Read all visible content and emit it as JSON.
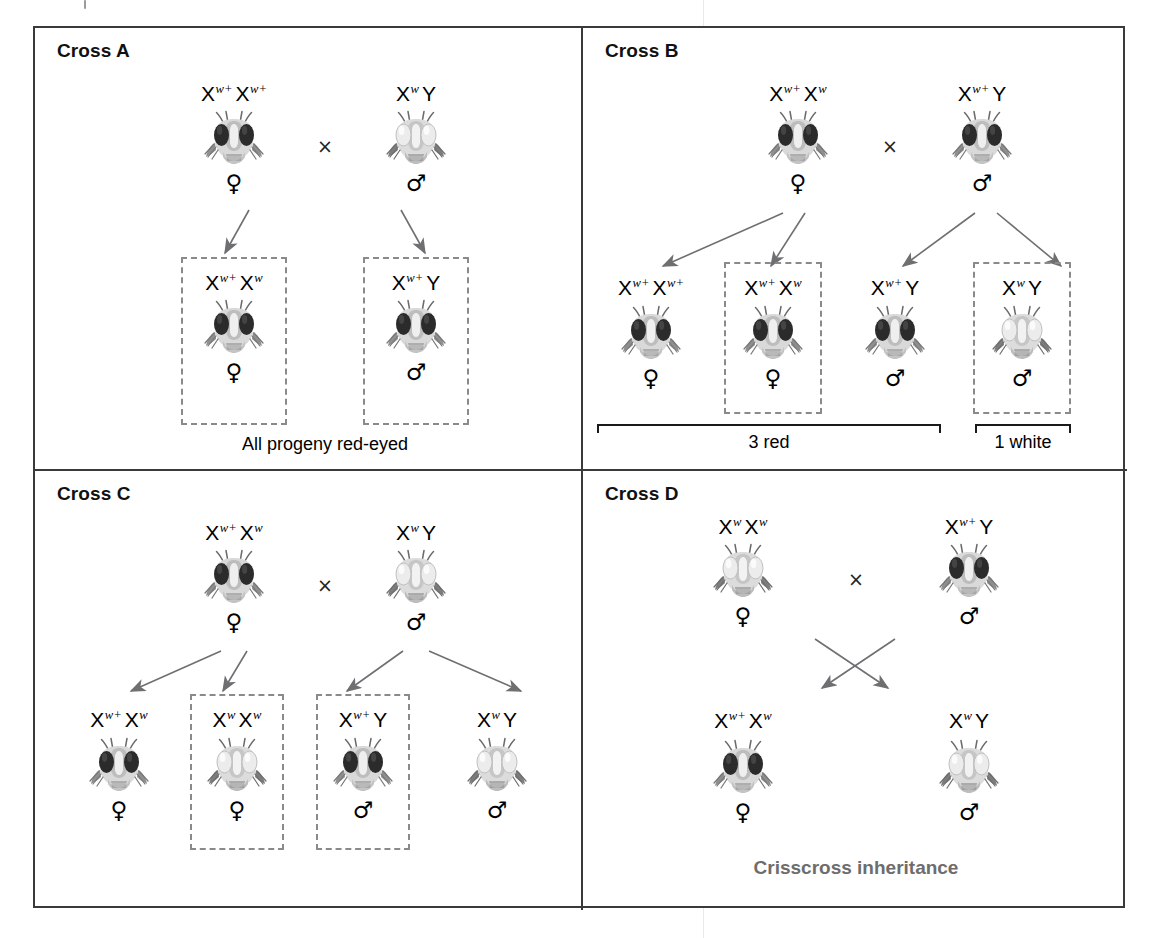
{
  "figure": {
    "eye_colors": {
      "red": "#2b2b2b",
      "white": "#e6e6e6"
    },
    "accent_gray": "#6d6d6d",
    "dash_gray": "#8a8a8a",
    "arrow_gray": "#6f6f72"
  },
  "symbols": {
    "female": "♀",
    "male": "♂",
    "multiply": "×",
    "allele_X": "X",
    "allele_Y": "Y",
    "sup_wildtype": "w+",
    "sup_white": "w"
  },
  "panels": [
    {
      "id": "cross-a",
      "title": "Cross A",
      "parents": [
        {
          "genotype_html": "X<sup>w+</sup>X<sup>w+</sup>",
          "sex": "♀",
          "eye": "red"
        },
        {
          "genotype_html": "X<sup>w</sup>Y",
          "sex": "♂",
          "eye": "white"
        }
      ],
      "cross_symbol": "×",
      "offspring": [
        {
          "genotype_html": "X<sup>w+</sup>X<sup>w</sup>",
          "sex": "♀",
          "eye": "red",
          "boxed": true
        },
        {
          "genotype_html": "X<sup>w+</sup>Y",
          "sex": "♂",
          "eye": "red",
          "boxed": true
        }
      ],
      "caption": "All progeny red-eyed",
      "brackets": []
    },
    {
      "id": "cross-b",
      "title": "Cross B",
      "parents": [
        {
          "genotype_html": "X<sup>w+</sup>X<sup>w</sup>",
          "sex": "♀",
          "eye": "red"
        },
        {
          "genotype_html": "X<sup>w+</sup>Y",
          "sex": "♂",
          "eye": "red"
        }
      ],
      "cross_symbol": "×",
      "offspring": [
        {
          "genotype_html": "X<sup>w+</sup>X<sup>w+</sup>",
          "sex": "♀",
          "eye": "red",
          "boxed": false
        },
        {
          "genotype_html": "X<sup>w+</sup>X<sup>w</sup>",
          "sex": "♀",
          "eye": "red",
          "boxed": true
        },
        {
          "genotype_html": "X<sup>w+</sup>Y",
          "sex": "♂",
          "eye": "red",
          "boxed": false
        },
        {
          "genotype_html": "X<sup>w</sup>Y",
          "sex": "♂",
          "eye": "white",
          "boxed": true
        }
      ],
      "caption": "",
      "brackets": [
        {
          "label": "3 red"
        },
        {
          "label": "1 white"
        }
      ]
    },
    {
      "id": "cross-c",
      "title": "Cross C",
      "parents": [
        {
          "genotype_html": "X<sup>w+</sup>X<sup>w</sup>",
          "sex": "♀",
          "eye": "red"
        },
        {
          "genotype_html": "X<sup>w</sup>Y",
          "sex": "♂",
          "eye": "white"
        }
      ],
      "cross_symbol": "×",
      "offspring": [
        {
          "genotype_html": "X<sup>w+</sup>X<sup>w</sup>",
          "sex": "♀",
          "eye": "red",
          "boxed": false
        },
        {
          "genotype_html": "X<sup>w</sup>X<sup>w</sup>",
          "sex": "♀",
          "eye": "white",
          "boxed": true
        },
        {
          "genotype_html": "X<sup>w+</sup>Y",
          "sex": "♂",
          "eye": "red",
          "boxed": true
        },
        {
          "genotype_html": "X<sup>w</sup>Y",
          "sex": "♂",
          "eye": "white",
          "boxed": false
        }
      ],
      "caption": "",
      "brackets": []
    },
    {
      "id": "cross-d",
      "title": "Cross D",
      "parents": [
        {
          "genotype_html": "X<sup>w</sup>X<sup>w</sup>",
          "sex": "♀",
          "eye": "white"
        },
        {
          "genotype_html": "X<sup>w+</sup>Y",
          "sex": "♂",
          "eye": "red"
        }
      ],
      "cross_symbol": "×",
      "offspring": [
        {
          "genotype_html": "X<sup>w+</sup>X<sup>w</sup>",
          "sex": "♀",
          "eye": "red",
          "boxed": false
        },
        {
          "genotype_html": "X<sup>w</sup>Y",
          "sex": "♂",
          "eye": "white",
          "boxed": false
        }
      ],
      "caption": "Crisscross inheritance",
      "brackets": []
    }
  ]
}
